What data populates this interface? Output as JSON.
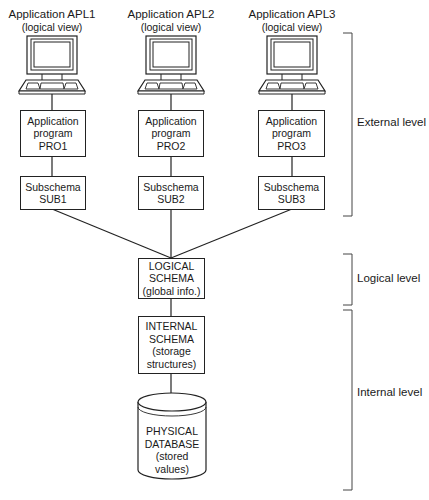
{
  "applications": [
    {
      "title": "Application APL1",
      "view": "(logical view)",
      "program": [
        "Application",
        "program",
        "PRO1"
      ],
      "subschema": [
        "Subschema",
        "SUB1"
      ]
    },
    {
      "title": "Application APL2",
      "view": "(logical view)",
      "program": [
        "Application",
        "program",
        "PRO2"
      ],
      "subschema": [
        "Subschema",
        "SUB2"
      ]
    },
    {
      "title": "Application APL3",
      "view": "(logical view)",
      "program": [
        "Application",
        "program",
        "PRO3"
      ],
      "subschema": [
        "Subschema",
        "SUB3"
      ]
    }
  ],
  "logical_schema": [
    "LOGICAL",
    "SCHEMA",
    "(global info.)"
  ],
  "internal_schema": [
    "INTERNAL",
    "SCHEMA",
    "(storage",
    "structures)"
  ],
  "physical_database": [
    "PHYSICAL",
    "DATABASE",
    "(stored",
    "values)"
  ],
  "levels": {
    "external": "External level",
    "logical": "Logical level",
    "internal": "Internal level"
  },
  "colors": {
    "line": "#222222",
    "background": "#ffffff"
  }
}
